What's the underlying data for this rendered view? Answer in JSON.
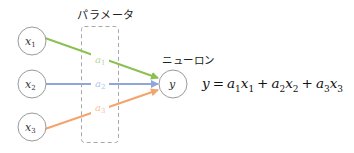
{
  "diagram": {
    "parameter_box_label": "パラメータ",
    "neuron_label": "ニューロン",
    "inputs": [
      {
        "name": "x",
        "sub": "1",
        "color": "#8cc152"
      },
      {
        "name": "x",
        "sub": "2",
        "color": "#8fa6dc"
      },
      {
        "name": "x",
        "sub": "3",
        "color": "#f4a46b"
      }
    ],
    "weights": [
      {
        "name": "a",
        "sub": "1"
      },
      {
        "name": "a",
        "sub": "2"
      },
      {
        "name": "a",
        "sub": "3"
      }
    ],
    "output": {
      "name": "y"
    },
    "equation": {
      "lhs": "y",
      "eq": "=",
      "terms": [
        {
          "a": "a",
          "a_sub": "1",
          "x": "x",
          "x_sub": "1"
        },
        {
          "a": "a",
          "a_sub": "2",
          "x": "x",
          "x_sub": "2"
        },
        {
          "a": "a",
          "a_sub": "3",
          "x": "x",
          "x_sub": "3"
        }
      ],
      "plus": "+"
    }
  }
}
